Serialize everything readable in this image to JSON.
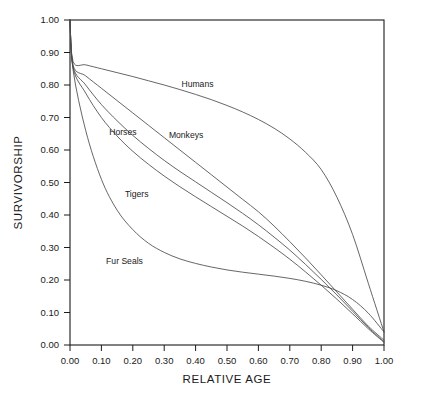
{
  "chart_data": {
    "type": "line",
    "title": "",
    "xlabel": "RELATIVE AGE",
    "ylabel": "SURVIVORSHIP",
    "xlim": [
      0.0,
      1.0
    ],
    "ylim": [
      0.0,
      1.0
    ],
    "grid": false,
    "legend": "inline-labels",
    "xticks": [
      "0.00",
      "0.10",
      "0.20",
      "0.30",
      "0.40",
      "0.50",
      "0.60",
      "0.70",
      "0.80",
      "0.90",
      "1.00"
    ],
    "yticks": [
      "0.00",
      "0.10",
      "0.20",
      "0.30",
      "0.40",
      "0.50",
      "0.60",
      "0.70",
      "0.80",
      "0.90",
      "1.00"
    ],
    "x": [
      0.0,
      0.01,
      0.05,
      0.1,
      0.15,
      0.2,
      0.25,
      0.3,
      0.35,
      0.4,
      0.45,
      0.5,
      0.55,
      0.6,
      0.65,
      0.7,
      0.75,
      0.8,
      0.85,
      0.9,
      0.95,
      1.0
    ],
    "series": [
      {
        "name": "Humans",
        "values": [
          1.0,
          0.872,
          0.862,
          0.85,
          0.838,
          0.826,
          0.813,
          0.8,
          0.786,
          0.771,
          0.755,
          0.737,
          0.717,
          0.694,
          0.667,
          0.634,
          0.593,
          0.54,
          0.455,
          0.34,
          0.19,
          0.04
        ]
      },
      {
        "name": "Monkeys",
        "values": [
          1.0,
          0.86,
          0.828,
          0.79,
          0.752,
          0.714,
          0.676,
          0.638,
          0.6,
          0.562,
          0.524,
          0.486,
          0.448,
          0.41,
          0.366,
          0.318,
          0.268,
          0.216,
          0.163,
          0.11,
          0.058,
          0.015
        ]
      },
      {
        "name": "Horses",
        "values": [
          1.0,
          0.856,
          0.8,
          0.74,
          0.69,
          0.645,
          0.605,
          0.568,
          0.534,
          0.502,
          0.47,
          0.438,
          0.405,
          0.37,
          0.332,
          0.292,
          0.248,
          0.202,
          0.154,
          0.104,
          0.054,
          0.01
        ]
      },
      {
        "name": "Tigers",
        "values": [
          1.0,
          0.852,
          0.775,
          0.7,
          0.643,
          0.596,
          0.556,
          0.52,
          0.487,
          0.456,
          0.426,
          0.396,
          0.366,
          0.334,
          0.3,
          0.264,
          0.225,
          0.184,
          0.141,
          0.096,
          0.05,
          0.008
        ]
      },
      {
        "name": "Fur Seals",
        "values": [
          1.0,
          0.845,
          0.66,
          0.51,
          0.415,
          0.355,
          0.313,
          0.285,
          0.265,
          0.251,
          0.24,
          0.231,
          0.224,
          0.218,
          0.212,
          0.205,
          0.196,
          0.184,
          0.167,
          0.14,
          0.098,
          0.04
        ]
      }
    ],
    "curve_labels": [
      {
        "text": "Humans",
        "x": 0.355,
        "y": 0.795
      },
      {
        "text": "Monkeys",
        "x": 0.315,
        "y": 0.637
      },
      {
        "text": "Horses",
        "x": 0.125,
        "y": 0.645
      },
      {
        "text": "Tigers",
        "x": 0.175,
        "y": 0.455
      },
      {
        "text": "Fur Seals",
        "x": 0.115,
        "y": 0.248
      }
    ],
    "colors": {
      "curve": "#4a4a4a",
      "axis": "#1a1a1a",
      "background": "#ffffff"
    }
  }
}
